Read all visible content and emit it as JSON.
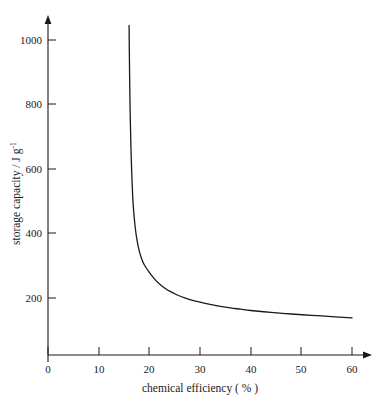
{
  "chart_data": {
    "type": "line",
    "title": "",
    "xlabel": "chemical efficiency ( % )",
    "ylabel": "storage capacity / J g",
    "ylabel_sup": "-1",
    "xlim": [
      0,
      62
    ],
    "ylim": [
      0,
      1100
    ],
    "grid": false,
    "legend": null,
    "xticks": [
      0,
      10,
      20,
      30,
      40,
      50,
      60
    ],
    "xtick_labels": [
      "0",
      "10",
      "20",
      "30",
      "40",
      "50",
      "60"
    ],
    "yticks": [
      200,
      400,
      600,
      800,
      1000
    ],
    "ytick_labels": [
      "200",
      "400",
      "600",
      "800",
      "1000"
    ],
    "series": [
      {
        "name": "storage capacity",
        "color": "#1a1a1a",
        "vertical_asymptote_x": 15.8,
        "horizontal_asymptote_y": 110,
        "x": [
          16.0,
          16.1,
          16.2,
          16.35,
          16.5,
          16.7,
          16.9,
          17.2,
          17.5,
          18.0,
          18.5,
          19.0,
          20.0,
          21.0,
          22.0,
          23.0,
          24.0,
          25.0,
          26.0,
          27.0,
          28.0,
          30.0,
          32.0,
          34.0,
          36.0,
          38.0,
          40.0,
          44.0,
          48.0,
          52.0,
          56.0,
          60.0
        ],
        "y": [
          1045,
          900,
          790,
          680,
          600,
          520,
          470,
          420,
          385,
          345,
          320,
          302,
          278,
          258,
          242,
          230,
          220,
          212,
          205,
          199,
          194,
          186,
          179,
          173,
          168,
          164,
          160,
          154,
          149,
          145,
          141,
          137
        ]
      }
    ]
  },
  "axis": {
    "x_arrow": "arrow-right",
    "y_arrow": "arrow-up"
  }
}
